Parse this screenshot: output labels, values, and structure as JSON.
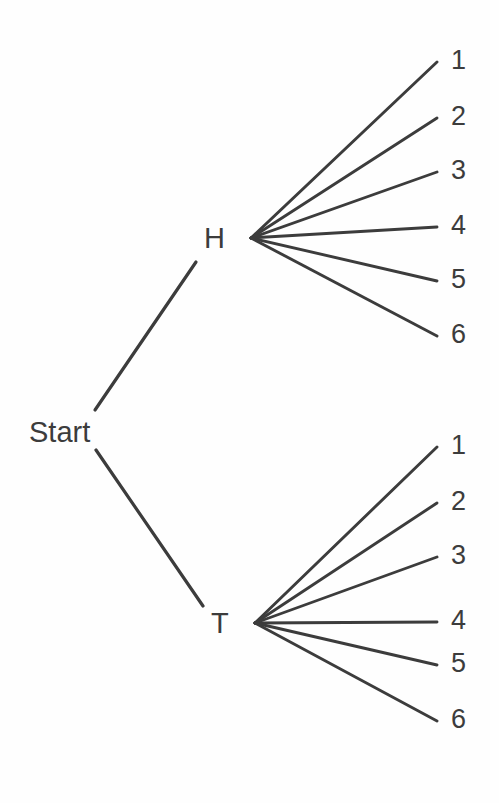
{
  "diagram": {
    "type": "probability-tree",
    "background_color": "#fefefe",
    "line_color": "#3c3c3c",
    "text_color": "#3c3c3c",
    "root": {
      "label": "Start",
      "x": 62,
      "y": 432
    },
    "level1": [
      {
        "id": "H",
        "label": "H",
        "x": 213,
        "y": 238,
        "fan_origin_x": 251,
        "fan_origin_y": 238
      },
      {
        "id": "T",
        "label": "T",
        "x": 219,
        "y": 623,
        "fan_origin_x": 255,
        "fan_origin_y": 623
      }
    ],
    "branches_root": [
      {
        "from": "Start",
        "to": "H",
        "x1": 95,
        "y1": 410,
        "x2": 196,
        "y2": 262
      },
      {
        "from": "Start",
        "to": "T",
        "x1": 96,
        "y1": 450,
        "x2": 203,
        "y2": 606
      }
    ],
    "leaf_labels_h": [
      "1",
      "2",
      "3",
      "4",
      "5",
      "6"
    ],
    "leaf_labels_t": [
      "1",
      "2",
      "3",
      "4",
      "5",
      "6"
    ],
    "leaf_y_h": [
      62,
      118,
      172,
      227,
      281,
      336
    ],
    "leaf_y_t": [
      447,
      503,
      557,
      622,
      665,
      721
    ],
    "leaf_text_y_h": [
      47,
      103,
      157,
      212,
      266,
      321
    ],
    "leaf_text_y_t": [
      432,
      488,
      542,
      607,
      650,
      706
    ],
    "leaf_end_x": 437,
    "leaf_label_x": 451
  },
  "chart_data": {
    "type": "tree",
    "nodes": [
      {
        "id": "start",
        "label": "Start",
        "level": 0
      },
      {
        "id": "H",
        "label": "H",
        "level": 1,
        "parent": "start"
      },
      {
        "id": "T",
        "label": "T",
        "level": 1,
        "parent": "start"
      },
      {
        "id": "H1",
        "label": "1",
        "level": 2,
        "parent": "H"
      },
      {
        "id": "H2",
        "label": "2",
        "level": 2,
        "parent": "H"
      },
      {
        "id": "H3",
        "label": "3",
        "level": 2,
        "parent": "H"
      },
      {
        "id": "H4",
        "label": "4",
        "level": 2,
        "parent": "H"
      },
      {
        "id": "H5",
        "label": "5",
        "level": 2,
        "parent": "H"
      },
      {
        "id": "H6",
        "label": "6",
        "level": 2,
        "parent": "H"
      },
      {
        "id": "T1",
        "label": "1",
        "level": 2,
        "parent": "T"
      },
      {
        "id": "T2",
        "label": "2",
        "level": 2,
        "parent": "T"
      },
      {
        "id": "T3",
        "label": "3",
        "level": 2,
        "parent": "T"
      },
      {
        "id": "T4",
        "label": "4",
        "level": 2,
        "parent": "T"
      },
      {
        "id": "T5",
        "label": "5",
        "level": 2,
        "parent": "T"
      },
      {
        "id": "T6",
        "label": "6",
        "level": 2,
        "parent": "T"
      }
    ],
    "edges": [
      [
        "start",
        "H"
      ],
      [
        "start",
        "T"
      ],
      [
        "H",
        "H1"
      ],
      [
        "H",
        "H2"
      ],
      [
        "H",
        "H3"
      ],
      [
        "H",
        "H4"
      ],
      [
        "H",
        "H5"
      ],
      [
        "H",
        "H6"
      ],
      [
        "T",
        "T1"
      ],
      [
        "T",
        "T2"
      ],
      [
        "T",
        "T3"
      ],
      [
        "T",
        "T4"
      ],
      [
        "T",
        "T5"
      ],
      [
        "T",
        "T6"
      ]
    ],
    "outcome_count": 12,
    "legend": [],
    "grid": false
  }
}
